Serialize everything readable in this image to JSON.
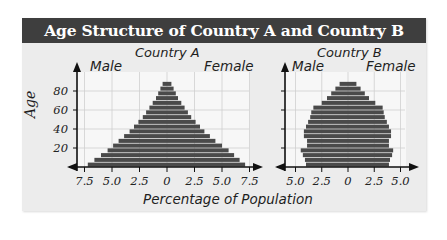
{
  "title": "Age Structure of Country A and Country B",
  "x_axis_label": "Percentage of Population",
  "y_axis_label": "Age",
  "y_ticks": [
    "20",
    "40",
    "60",
    "80"
  ],
  "colors": {
    "title_bg": "#3e3e3e",
    "panel_bg": "#ececec",
    "plot_bg": "#f7f7f7",
    "bar": "#4a4a4a",
    "grid": "#cfcfcf"
  },
  "countries": [
    {
      "name": "Country A",
      "male_label": "Male",
      "female_label": "Female",
      "x_ticks": [
        "7.5",
        "5.0",
        "2.5",
        "0",
        "2.5",
        "5.0",
        "7.5"
      ]
    },
    {
      "name": "Country B",
      "male_label": "Male",
      "female_label": "Female",
      "x_ticks": [
        "5.0",
        "2.5",
        "0",
        "2.5",
        "5.0"
      ]
    }
  ],
  "chart_data": [
    {
      "type": "bar",
      "subtype": "population-pyramid",
      "title": "Country A",
      "xlabel": "Percentage of Population",
      "ylabel": "Age",
      "xlim": [
        -7.5,
        7.5
      ],
      "ylim": [
        0,
        90
      ],
      "grid": true,
      "categories": [
        "0-4",
        "5-9",
        "10-14",
        "15-19",
        "20-24",
        "25-29",
        "30-34",
        "35-39",
        "40-44",
        "45-49",
        "50-54",
        "55-59",
        "60-64",
        "65-69",
        "70-74",
        "75-79",
        "80-84",
        "85-89"
      ],
      "series": [
        {
          "name": "Male",
          "values": [
            7.2,
            6.6,
            6.0,
            5.4,
            4.9,
            4.4,
            3.9,
            3.4,
            3.0,
            2.6,
            2.2,
            1.9,
            1.6,
            1.3,
            1.0,
            0.8,
            0.6,
            0.4
          ]
        },
        {
          "name": "Female",
          "values": [
            7.1,
            6.6,
            6.1,
            5.6,
            5.0,
            4.4,
            3.9,
            3.4,
            3.0,
            2.6,
            2.2,
            1.9,
            1.6,
            1.3,
            1.0,
            0.8,
            0.6,
            0.4
          ]
        }
      ]
    },
    {
      "type": "bar",
      "subtype": "population-pyramid",
      "title": "Country B",
      "xlabel": "Percentage of Population",
      "ylabel": "Age",
      "xlim": [
        -5.0,
        5.0
      ],
      "ylim": [
        0,
        90
      ],
      "grid": true,
      "categories": [
        "0-4",
        "5-9",
        "10-14",
        "15-19",
        "20-24",
        "25-29",
        "30-34",
        "35-39",
        "40-44",
        "45-49",
        "50-54",
        "55-59",
        "60-64",
        "65-69",
        "70-74",
        "75-79",
        "80-84",
        "85-89"
      ],
      "series": [
        {
          "name": "Male",
          "values": [
            4.0,
            4.1,
            4.3,
            4.5,
            3.9,
            3.9,
            4.2,
            4.2,
            4.0,
            3.8,
            3.6,
            3.5,
            3.3,
            2.5,
            2.0,
            1.6,
            1.2,
            0.8
          ]
        },
        {
          "name": "Female",
          "values": [
            3.9,
            4.0,
            4.2,
            4.3,
            3.9,
            3.9,
            4.1,
            4.1,
            3.9,
            3.7,
            3.5,
            3.4,
            3.3,
            2.6,
            2.0,
            1.6,
            1.2,
            0.8
          ]
        }
      ]
    }
  ]
}
